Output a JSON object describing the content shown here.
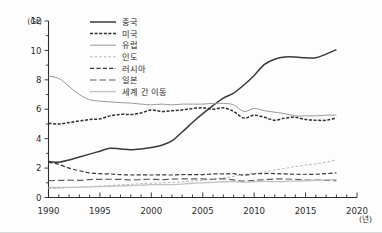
{
  "axes": {
    "y_unit_label": "(Gt)",
    "x_unit_label": "(년)",
    "y_ticks": [
      "12",
      "10",
      "8",
      "6",
      "4",
      "2",
      "0"
    ],
    "x_ticks": [
      "1990",
      "1995",
      "2000",
      "2005",
      "2010",
      "2015",
      "2020"
    ]
  },
  "legend": {
    "items": [
      {
        "label": "중국",
        "color": "#3a3a3a",
        "width": 1.5,
        "dash": "none"
      },
      {
        "label": "미국",
        "color": "#2e2e2e",
        "width": 1.5,
        "dash": "3,1.6"
      },
      {
        "label": "유럽",
        "color": "#9a9a9a",
        "width": 1.0,
        "dash": "none"
      },
      {
        "label": "인도",
        "color": "#b6b6b6",
        "width": 1.0,
        "dash": "2.6,2.0"
      },
      {
        "label": "러시아",
        "color": "#3a3a3a",
        "width": 1.2,
        "dash": "4.2,2.2"
      },
      {
        "label": "일본",
        "color": "#5f5f5f",
        "width": 1.2,
        "dash": "6.5,3.0"
      },
      {
        "label": "세계 간 이동",
        "color": "#c2c2c2",
        "width": 1.3,
        "dash": "none"
      }
    ]
  },
  "chart_data": {
    "type": "line",
    "title": "",
    "xlabel": "년",
    "ylabel": "Gt",
    "xlim": [
      1990,
      2020
    ],
    "ylim": [
      0,
      12
    ],
    "grid": false,
    "legend_position": "top-center",
    "x": [
      1990,
      1991,
      1992,
      1993,
      1994,
      1995,
      1996,
      1997,
      1998,
      1999,
      2000,
      2001,
      2002,
      2003,
      2004,
      2005,
      2006,
      2007,
      2008,
      2009,
      2010,
      2011,
      2012,
      2013,
      2014,
      2015,
      2016,
      2017,
      2018
    ],
    "series": [
      {
        "name": "중국",
        "values": [
          2.45,
          2.4,
          2.55,
          2.75,
          2.95,
          3.15,
          3.35,
          3.3,
          3.25,
          3.3,
          3.4,
          3.55,
          3.85,
          4.45,
          5.1,
          5.7,
          6.25,
          6.75,
          7.1,
          7.65,
          8.3,
          9.05,
          9.4,
          9.55,
          9.55,
          9.5,
          9.5,
          9.75,
          10.05
        ]
      },
      {
        "name": "미국",
        "values": [
          5.05,
          5.0,
          5.1,
          5.2,
          5.3,
          5.35,
          5.55,
          5.65,
          5.65,
          5.75,
          5.95,
          5.85,
          5.9,
          5.95,
          6.05,
          6.1,
          6.0,
          6.1,
          5.85,
          5.4,
          5.6,
          5.45,
          5.25,
          5.4,
          5.45,
          5.3,
          5.25,
          5.25,
          5.4
        ]
      },
      {
        "name": "유럽",
        "values": [
          8.25,
          8.1,
          7.55,
          7.0,
          6.65,
          6.55,
          6.5,
          6.45,
          6.42,
          6.35,
          6.3,
          6.35,
          6.3,
          6.35,
          6.35,
          6.35,
          6.4,
          6.4,
          6.3,
          5.85,
          6.05,
          5.9,
          5.8,
          5.7,
          5.55,
          5.55,
          5.55,
          5.6,
          5.6
        ]
      },
      {
        "name": "인도",
        "values": [
          0.6,
          0.63,
          0.67,
          0.7,
          0.74,
          0.78,
          0.82,
          0.86,
          0.89,
          0.94,
          0.97,
          0.99,
          1.03,
          1.06,
          1.12,
          1.17,
          1.24,
          1.33,
          1.43,
          1.57,
          1.65,
          1.74,
          1.87,
          1.97,
          2.11,
          2.2,
          2.28,
          2.4,
          2.55
        ]
      },
      {
        "name": "러시아",
        "values": [
          2.4,
          2.25,
          2.0,
          1.82,
          1.68,
          1.62,
          1.6,
          1.55,
          1.53,
          1.54,
          1.53,
          1.54,
          1.53,
          1.56,
          1.56,
          1.56,
          1.6,
          1.6,
          1.62,
          1.52,
          1.6,
          1.63,
          1.63,
          1.6,
          1.58,
          1.58,
          1.58,
          1.62,
          1.68
        ]
      },
      {
        "name": "일본",
        "values": [
          1.15,
          1.16,
          1.18,
          1.17,
          1.22,
          1.23,
          1.24,
          1.23,
          1.19,
          1.22,
          1.24,
          1.22,
          1.25,
          1.26,
          1.26,
          1.26,
          1.24,
          1.27,
          1.2,
          1.11,
          1.17,
          1.21,
          1.26,
          1.26,
          1.23,
          1.19,
          1.18,
          1.17,
          1.14
        ]
      },
      {
        "name": "세계 간 이동",
        "values": [
          0.68,
          0.68,
          0.69,
          0.7,
          0.72,
          0.74,
          0.76,
          0.79,
          0.81,
          0.84,
          0.87,
          0.87,
          0.88,
          0.91,
          0.97,
          1.0,
          1.03,
          1.07,
          1.08,
          1.04,
          1.07,
          1.09,
          1.08,
          1.09,
          1.11,
          1.14,
          1.17,
          1.2,
          1.22
        ]
      }
    ]
  }
}
